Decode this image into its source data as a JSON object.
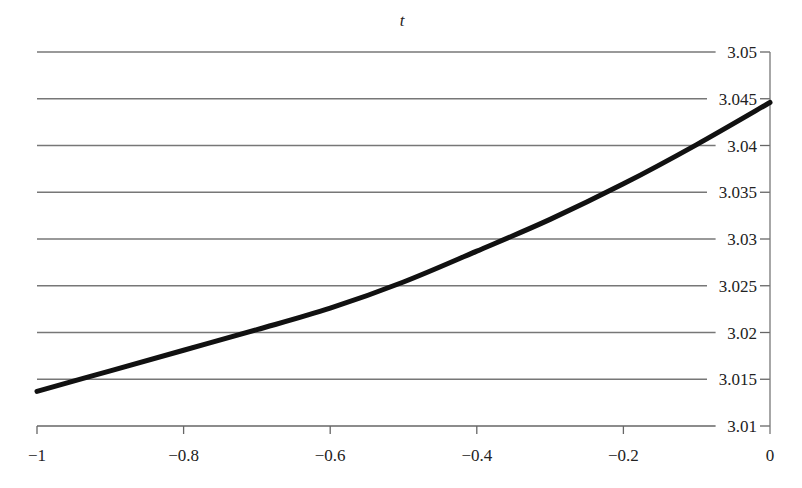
{
  "chart_data": {
    "type": "line",
    "title": "t",
    "xlabel": "",
    "ylabel": "",
    "xlim": [
      -1,
      0
    ],
    "ylim": [
      3.01,
      3.05
    ],
    "x_ticks": [
      -1,
      -0.8,
      -0.6,
      -0.4,
      -0.2,
      0
    ],
    "x_tick_labels": [
      "−1",
      "−0.8",
      "−0.6",
      "−0.4",
      "−0.2",
      "0"
    ],
    "y_ticks": [
      3.01,
      3.015,
      3.02,
      3.025,
      3.03,
      3.035,
      3.04,
      3.045,
      3.05
    ],
    "y_tick_labels": [
      "3.01",
      "3.015",
      "3.02",
      "3.025",
      "3.03",
      "3.035",
      "3.04",
      "3.045",
      "3.05"
    ],
    "y_axis_position": "right",
    "grid": "horizontal",
    "legend": null,
    "series": [
      {
        "name": "t",
        "color": "#111111",
        "x": [
          -1,
          -0.9,
          -0.8,
          -0.7,
          -0.6,
          -0.5,
          -0.4,
          -0.3,
          -0.2,
          -0.1,
          0
        ],
        "values": [
          3.0137,
          3.0159,
          3.0181,
          3.0203,
          3.0226,
          3.0254,
          3.0287,
          3.0321,
          3.0359,
          3.0401,
          3.0446
        ]
      }
    ]
  }
}
